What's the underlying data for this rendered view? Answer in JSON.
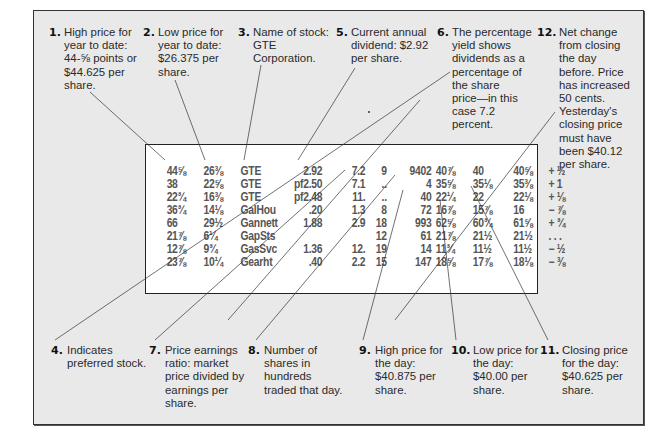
{
  "callouts": [
    {
      "id": "1",
      "num": "1.",
      "text": "High price for\nyear to date:\n44-⅝ points or\n$44.625 per\nshare."
    },
    {
      "id": "2",
      "num": "2.",
      "text": "Low price for\nyear to date:\n$26.375 per\nshare."
    },
    {
      "id": "3",
      "num": "3.",
      "text": "Name of stock:\nGTE\nCorporation."
    },
    {
      "id": "5",
      "num": "5.",
      "text": "Current annual\ndividend: $2.92\nper share."
    },
    {
      "id": "6",
      "num": "6.",
      "text": "The percentage\nyield shows\ndividends as a\npercentage of\nthe share\nprice—in this\ncase 7.2\npercent."
    },
    {
      "id": "12",
      "num": "12.",
      "text": "Net change\nfrom closing\nthe day\nbefore. Price\nhas increased\n50 cents.\nYesterday's\nclosing price\nmust have\nbeen $40.12\nper share."
    },
    {
      "id": "4",
      "num": "4.",
      "text": "Indicates\npreferred stock."
    },
    {
      "id": "7",
      "num": "7.",
      "text": "Price earnings\nratio: market\nprice divided by\nearnings per\nshare."
    },
    {
      "id": "8",
      "num": "8.",
      "text": "Number of\nshares in\nhundreds\ntraded that day."
    },
    {
      "id": "9",
      "num": "9.",
      "text": "High price for\nthe day:\n$40.875 per\nshare."
    },
    {
      "id": "10",
      "num": "10.",
      "text": "Low price for\nthe day:\n$40.00 per\nshare."
    },
    {
      "id": "11",
      "num": "11.",
      "text": "Closing price\nfor the day:\n$40.625 per\nshare."
    }
  ],
  "stock_table": {
    "rows": [
      [
        "44⅝",
        "26⅜",
        "GTE",
        "2.92",
        "7.2",
        "9",
        "9402",
        "40⅞",
        "40",
        "40⅝",
        "+ ½"
      ],
      [
        "38",
        "22⅝",
        "GTE",
        "pf2.50",
        "7.1",
        "..",
        "4",
        "35⅝",
        "35⅛",
        "35⅜",
        "+ 1"
      ],
      [
        "22¾",
        "16⅜",
        "GTE",
        "pf2.48",
        "11.",
        "..",
        "40",
        "22¼",
        "22",
        "22⅛",
        "+ ⅛"
      ],
      [
        "36¾",
        "14⅛",
        "GalHou",
        ".20",
        "1.3",
        "8",
        "72",
        "16⅞",
        "15⅞",
        "16",
        "− ⅞"
      ],
      [
        "66",
        "29½",
        "Gannett",
        "1.88",
        "2.9",
        "18",
        "993",
        "62⅝",
        "60¾",
        "61⅝",
        "+ ¾"
      ],
      [
        "21⅞",
        "6¼",
        "GapSts",
        "",
        "",
        "12",
        "61",
        "21⅞",
        "21½",
        "21½",
        ". . ."
      ],
      [
        "12⅞",
        "9¾",
        "GasSvc",
        "1.36",
        "12.",
        "19",
        "14",
        "11¾",
        "11½",
        "11½",
        "− ½"
      ],
      [
        "23⅞",
        "10¼",
        "Gearht",
        ".40",
        "2.2",
        "15",
        "147",
        "18⅝",
        "17⅞",
        "18⅛",
        "− ⅜"
      ]
    ]
  }
}
